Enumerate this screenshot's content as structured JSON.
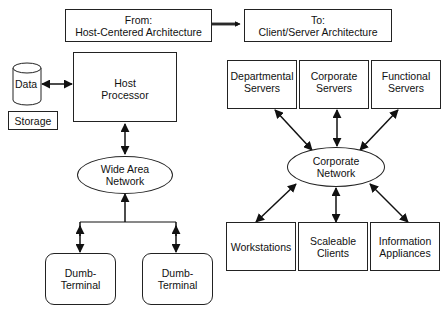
{
  "header": {
    "from": {
      "line1": "From:",
      "line2": "Host-Centered Architecture"
    },
    "to": {
      "line1": "To:",
      "line2": "Client/Server Architecture"
    }
  },
  "left": {
    "data_storage": {
      "label": "Data",
      "caption": "Storage"
    },
    "host_processor": {
      "line1": "Host",
      "line2": "Processor"
    },
    "wan": {
      "line1": "Wide Area",
      "line2": "Network"
    },
    "terminals": [
      {
        "line1": "Dumb-",
        "line2": "Terminal"
      },
      {
        "line1": "Dumb-",
        "line2": "Terminal"
      }
    ]
  },
  "right": {
    "servers": [
      {
        "line1": "Departmental",
        "line2": "Servers"
      },
      {
        "line1": "Corporate",
        "line2": "Servers"
      },
      {
        "line1": "Functional",
        "line2": "Servers"
      }
    ],
    "network": {
      "line1": "Corporate",
      "line2": "Network"
    },
    "clients": [
      {
        "line1": "Workstations",
        "line2": ""
      },
      {
        "line1": "Scaleable",
        "line2": "Clients"
      },
      {
        "line1": "Information",
        "line2": "Appliances"
      }
    ]
  },
  "colors": {
    "stroke": "#222222",
    "background": "#ffffff"
  }
}
